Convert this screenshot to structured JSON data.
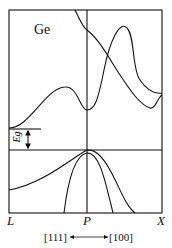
{
  "diagram": {
    "material_label": "Ge",
    "gap_label": "Eg",
    "k_points": {
      "left": "L",
      "center": "P",
      "right": "X"
    },
    "directions": {
      "left": "[111]",
      "right": "[100]"
    },
    "line_color": "#111111",
    "background": "#ffffff"
  }
}
